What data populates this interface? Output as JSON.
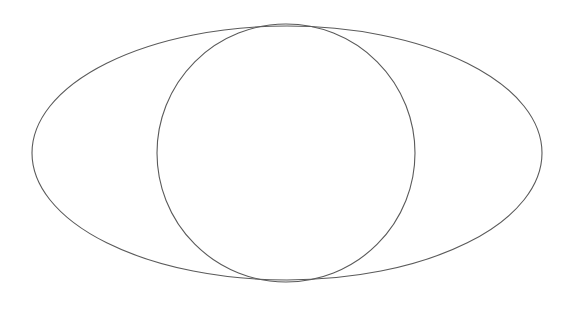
{
  "canvas": {
    "width": 581,
    "height": 312,
    "background": "#ffffff"
  },
  "diagram": {
    "stroke_color": "#5a5a5a",
    "stroke_width": 1.1,
    "shapes": [
      {
        "type": "ellipse",
        "name": "outer-ellipse",
        "cx": 287,
        "cy": 153,
        "rx": 255,
        "ry": 127
      },
      {
        "type": "circle",
        "name": "inner-circle",
        "cx": 286,
        "cy": 153,
        "r": 129
      }
    ]
  }
}
